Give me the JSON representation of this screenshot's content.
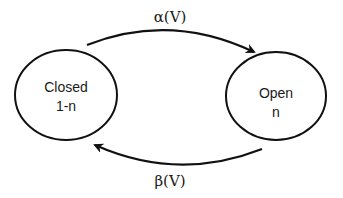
{
  "diagram": {
    "type": "state-transition",
    "states": [
      {
        "id": "closed",
        "label_line1": "Closed",
        "label_line2": "1-n"
      },
      {
        "id": "open",
        "label_line1": "Open",
        "label_line2": "n"
      }
    ],
    "transitions": [
      {
        "from": "closed",
        "to": "open",
        "label": "α(V)"
      },
      {
        "from": "open",
        "to": "closed",
        "label": "β(V)"
      }
    ],
    "colors": {
      "stroke": "#111111",
      "text": "#1a1a1a",
      "background": "#ffffff"
    }
  }
}
